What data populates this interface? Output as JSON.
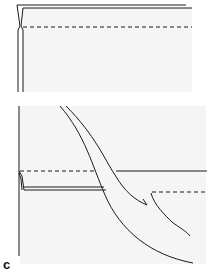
{
  "figure": {
    "panel_label": "c",
    "colors": {
      "line": "#1a1a1a",
      "panel_fill": "#f5f5f5",
      "background": "#ffffff"
    },
    "top_panel": {
      "description": "folded sheet with dashed fold line"
    },
    "bottom_panel": {
      "description": "sheet with curved incision / tongue flap and dashed fold lines"
    }
  }
}
